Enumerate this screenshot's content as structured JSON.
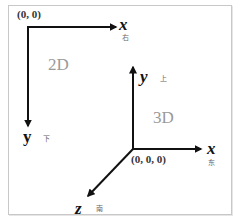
{
  "diagram": {
    "colors": {
      "axis": "#111111",
      "frame": "#c8c8c8",
      "dim_label": "#9a9a9a",
      "cn_label": "#666666"
    },
    "two_d": {
      "label": "2D",
      "origin_label": "(0, 0)",
      "x_axis": {
        "label": "x",
        "direction": "右"
      },
      "y_axis": {
        "label": "y",
        "direction": "下"
      }
    },
    "three_d": {
      "label": "3D",
      "origin_label": "(0, 0, 0)",
      "x_axis": {
        "label": "x",
        "direction": "东"
      },
      "y_axis": {
        "label": "y",
        "direction": "上"
      },
      "z_axis": {
        "label": "z",
        "direction": "南"
      }
    }
  }
}
